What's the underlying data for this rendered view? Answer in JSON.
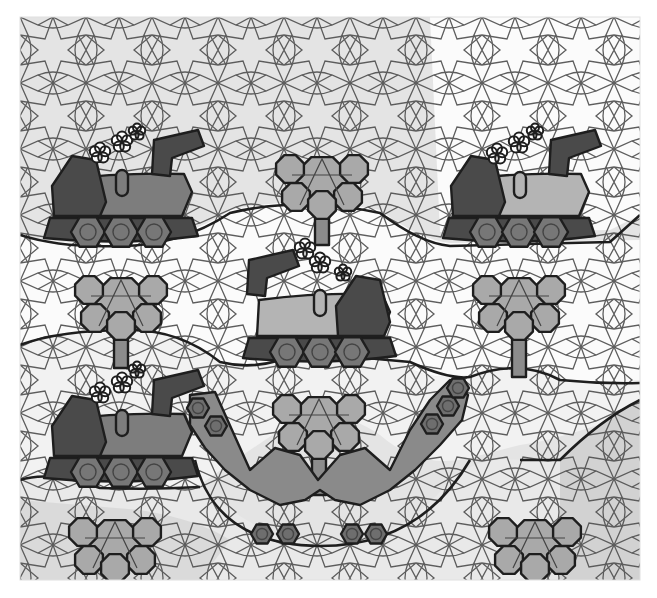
{
  "canvas": {
    "width": 657,
    "height": 598,
    "art_left": 20,
    "art_top": 17,
    "art_right": 640,
    "art_bottom": 580
  },
  "colors": {
    "page_bg": "#ffffff",
    "band_light": "#e4e4e4",
    "band_white": "#fbfbfb",
    "band_gray": "#cfcfcf",
    "line": "#555555",
    "outline": "#1e1e1e",
    "dark_tile": "#4a4a4a",
    "mid_tile": "#7d7d7d",
    "light_tile": "#b4b4b4",
    "tree_tile": "#a9a9a9",
    "puff": "#ffffff"
  },
  "trains": [
    {
      "name": "train-top-left",
      "facing": "right",
      "wheels": [
        [
          88,
          232
        ],
        [
          121,
          232
        ],
        [
          154,
          232
        ]
      ],
      "puffs": [
        [
          100,
          153
        ],
        [
          122,
          142
        ],
        [
          137,
          132
        ]
      ],
      "chimney": [
        122,
        178
      ],
      "body_tone": "mid"
    },
    {
      "name": "train-top-right",
      "facing": "right",
      "wheels": [
        [
          487,
          232
        ],
        [
          519,
          232
        ],
        [
          551,
          232
        ]
      ],
      "puffs": [
        [
          497,
          154
        ],
        [
          519,
          143
        ],
        [
          535,
          132
        ]
      ],
      "chimney": [
        520,
        180
      ],
      "body_tone": "light"
    },
    {
      "name": "train-center",
      "facing": "left",
      "wheels": [
        [
          287,
          352
        ],
        [
          320,
          352
        ],
        [
          352,
          352
        ]
      ],
      "puffs": [
        [
          305,
          249
        ],
        [
          320,
          263
        ],
        [
          343,
          273
        ]
      ],
      "chimney": [
        320,
        298
      ],
      "body_tone": "light"
    },
    {
      "name": "train-bottom-left",
      "facing": "right",
      "wheels": [
        [
          88,
          472
        ],
        [
          121,
          472
        ],
        [
          154,
          472
        ]
      ],
      "puffs": [
        [
          100,
          393
        ],
        [
          122,
          383
        ],
        [
          137,
          370
        ]
      ],
      "chimney": [
        122,
        418
      ],
      "body_tone": "mid"
    }
  ],
  "trees": [
    {
      "name": "tree-top-center",
      "cx": 322,
      "top": 155,
      "trunk_bottom": 245
    },
    {
      "name": "tree-mid-left",
      "cx": 121,
      "top": 276,
      "trunk_bottom": 368
    },
    {
      "name": "tree-mid-right",
      "cx": 519,
      "top": 276,
      "trunk_bottom": 377
    },
    {
      "name": "tree-bottom-center",
      "cx": 319,
      "top": 395,
      "trunk_bottom": 495
    },
    {
      "name": "tree-bottom-left",
      "cx": 115,
      "top": 518,
      "trunk_bottom": 580
    },
    {
      "name": "tree-bottom-right",
      "cx": 535,
      "top": 518,
      "trunk_bottom": 580
    }
  ],
  "curved_track": {
    "name": "u-shaped-train",
    "wheels": [
      [
        198,
        408
      ],
      [
        216,
        426
      ],
      [
        262,
        534
      ],
      [
        288,
        534
      ],
      [
        352,
        534
      ],
      [
        376,
        534
      ],
      [
        432,
        424
      ],
      [
        448,
        406
      ],
      [
        458,
        388
      ]
    ]
  }
}
